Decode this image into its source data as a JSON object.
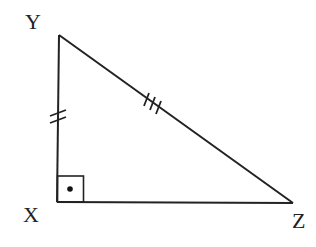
{
  "diagram": {
    "type": "right-triangle",
    "colors": {
      "stroke": "#222222",
      "background": "#ffffff"
    },
    "vertices": {
      "X": {
        "label": "X",
        "x": 57,
        "y": 202
      },
      "Y": {
        "label": "Y",
        "x": 59,
        "y": 35
      },
      "Z": {
        "label": "Z",
        "x": 293,
        "y": 203
      }
    },
    "right_angle_at": "X",
    "tick_marks": [
      {
        "side": "XY",
        "count": 2
      },
      {
        "side": "YZ",
        "count": 3
      }
    ]
  }
}
